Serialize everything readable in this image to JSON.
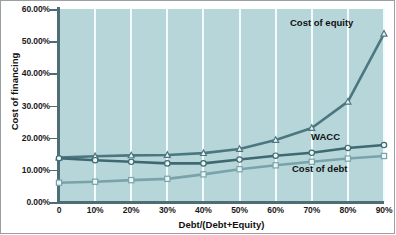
{
  "chart_data": {
    "type": "line",
    "title": "",
    "xlabel": "Debt/(Debt+Equity)",
    "ylabel": "Cost of financing",
    "x": [
      0,
      10,
      20,
      30,
      40,
      50,
      60,
      70,
      80,
      90
    ],
    "categories": [
      "0",
      "10%",
      "20%",
      "30%",
      "40%",
      "50%",
      "60%",
      "70%",
      "80%",
      "90%"
    ],
    "xtick_labels": [
      "0",
      "10%",
      "20%",
      "30%",
      "40%",
      "50%",
      "60%",
      "70%",
      "80%",
      "90%"
    ],
    "ytick_labels": [
      "0.00%",
      "10.00%",
      "20.00%",
      "30.00%",
      "40.00%",
      "50.00%",
      "60.00%"
    ],
    "ytick_values": [
      0,
      10,
      20,
      30,
      40,
      50,
      60
    ],
    "xlim": [
      0,
      90
    ],
    "ylim": [
      0,
      60
    ],
    "grid": "vertical-only",
    "legend_position": "inline-annotations",
    "series": [
      {
        "name": "Cost of equity",
        "marker": "triangle",
        "values": [
          13.8,
          14.2,
          14.5,
          14.6,
          15.2,
          16.5,
          19.3,
          23.0,
          31.2,
          52.3
        ]
      },
      {
        "name": "WACC",
        "marker": "circle",
        "values": [
          13.6,
          13.0,
          12.5,
          12.0,
          12.0,
          13.2,
          14.4,
          15.3,
          16.8,
          17.7
        ]
      },
      {
        "name": "Cost of debt",
        "marker": "square",
        "values": [
          6.0,
          6.3,
          6.8,
          7.2,
          8.6,
          10.2,
          11.4,
          12.5,
          13.5,
          14.3
        ]
      }
    ],
    "annotations": [
      {
        "text": "Cost of equity",
        "series": "Cost of equity"
      },
      {
        "text": "WACC",
        "series": "WACC"
      },
      {
        "text": "Cost of debt",
        "series": "Cost of debt"
      }
    ],
    "colors": {
      "plot_background": "#b6d6da",
      "gridline": "#f2fafb",
      "axis": "#4f6d73",
      "line_cost_of_equity": "#4d7780",
      "line_wacc": "#3f6970",
      "line_cost_of_debt": "#7aa3a9",
      "marker_fill": "#eaf6f7",
      "text": "#111111",
      "figure_background": "#ffffff"
    }
  },
  "labels": {
    "cost_of_equity": "Cost of equity",
    "wacc": "WACC",
    "cost_of_debt": "Cost of debt"
  }
}
